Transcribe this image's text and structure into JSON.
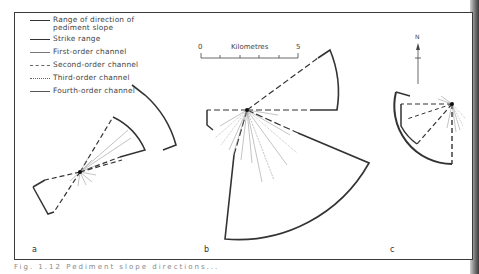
{
  "figure": {
    "legend": [
      {
        "label": "Range of direction of",
        "label2": "pediment slope",
        "style": "thick-solid"
      },
      {
        "label": "Strike range",
        "style": "thick-solid"
      },
      {
        "label": "First-order channel",
        "style": "thin-solid"
      },
      {
        "label": "Second-order channel",
        "style": "dashed"
      },
      {
        "label": "Third-order channel",
        "style": "dotted"
      },
      {
        "label": "Fourth-order channel",
        "style": "thick-solid"
      }
    ],
    "scale_bar": {
      "start": "0",
      "title": "Kilometres",
      "end": "5"
    },
    "north_arrow": {
      "label": "N"
    },
    "panels": [
      {
        "id": "a",
        "label": "a"
      },
      {
        "id": "b",
        "label": "b"
      },
      {
        "id": "c",
        "label": "c"
      }
    ],
    "caption": "Fig. 1.12  Pediment slope directions..."
  }
}
